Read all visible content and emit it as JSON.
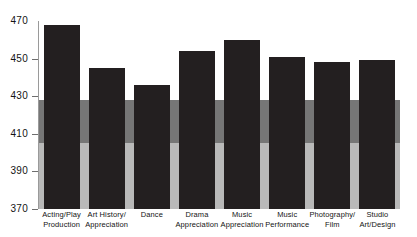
{
  "chart_data": {
    "type": "bar",
    "title": "",
    "subtitle": "",
    "xlabel": "",
    "ylabel": "",
    "ylim": [
      370,
      470
    ],
    "yticks": [
      470,
      450,
      430,
      410,
      390,
      370
    ],
    "grid": false,
    "legend": false,
    "categories": [
      "Acting/Play Production",
      "Art History/ Appreciation",
      "Dance",
      "Drama Appreciation",
      "Music Appreciation",
      "Music Performance",
      "Photography/ Film",
      "Studio Art/Design"
    ],
    "category_lines": [
      [
        "Acting/Play",
        "Production"
      ],
      [
        "Art History/",
        "Appreciation"
      ],
      [
        "Dance",
        ""
      ],
      [
        "Drama",
        "Appreciation"
      ],
      [
        "Music",
        "Appreciation"
      ],
      [
        "Music",
        "Performance"
      ],
      [
        "Photography/",
        "Film"
      ],
      [
        "Studio",
        "Art/Design"
      ]
    ],
    "values": [
      468,
      445,
      436,
      454,
      460,
      451,
      448,
      449
    ],
    "bar_color": "#231f20",
    "bands": [
      {
        "name": "upper-white-band",
        "from": 470,
        "to": 428,
        "color": "#ffffff"
      },
      {
        "name": "middle-gray-band",
        "from": 428,
        "to": 405,
        "color": "#767676"
      },
      {
        "name": "lower-light-gray-band",
        "from": 405,
        "to": 370,
        "color": "#b9b9b9"
      }
    ]
  },
  "axis": {
    "tick_labels": [
      "470",
      "450",
      "430",
      "410",
      "390",
      "370"
    ]
  }
}
